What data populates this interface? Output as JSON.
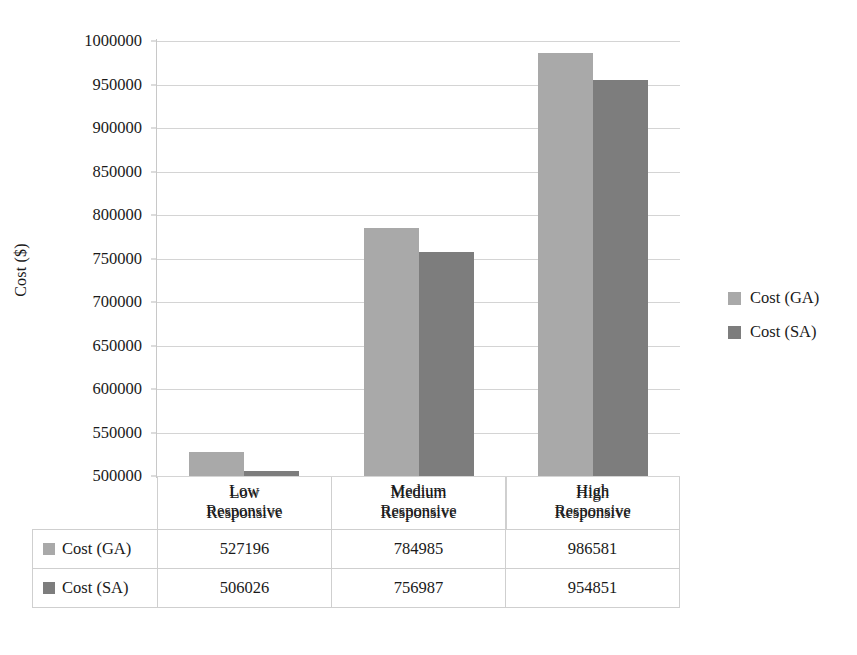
{
  "chart_data": {
    "type": "bar",
    "title": "",
    "xlabel": "",
    "ylabel": "Cost ($)",
    "categories": [
      "Low Responsive",
      "Medium Responsive",
      "High Responsive"
    ],
    "category_lines": [
      [
        "Low",
        "Responsive"
      ],
      [
        "Medium",
        "Responsive"
      ],
      [
        "High",
        "Responsive"
      ]
    ],
    "series": [
      {
        "name": "Cost (GA)",
        "color": "#a9a9a9",
        "values": [
          527196,
          784985,
          986581
        ]
      },
      {
        "name": "Cost (SA)",
        "color": "#7d7d7d",
        "values": [
          506026,
          756987,
          954851
        ]
      }
    ],
    "ylim": [
      500000,
      1000000
    ],
    "ytick_step": 50000,
    "yticks": [
      1000000,
      950000,
      900000,
      850000,
      800000,
      750000,
      700000,
      650000,
      600000,
      550000,
      500000
    ],
    "ytick_labels": [
      "1000000",
      "950000",
      "900000",
      "850000",
      "800000",
      "750000",
      "700000",
      "650000",
      "600000",
      "550000",
      "500000"
    ],
    "grid": true,
    "legend_position": "right",
    "data_table_visible": true
  },
  "legend": {
    "items": [
      {
        "label": "Cost (GA)",
        "swatch": "ga"
      },
      {
        "label": "Cost (SA)",
        "swatch": "sa"
      }
    ]
  },
  "table": {
    "corner_label": "",
    "column_headers": [
      "Low Responsive",
      "Medium Responsive",
      "High Responsive"
    ],
    "rows": [
      {
        "series": "Cost (GA)",
        "swatch": "ga",
        "cells": [
          "527196",
          "784985",
          "986581"
        ]
      },
      {
        "series": "Cost (SA)",
        "swatch": "sa",
        "cells": [
          "506026",
          "756987",
          "954851"
        ]
      }
    ]
  }
}
